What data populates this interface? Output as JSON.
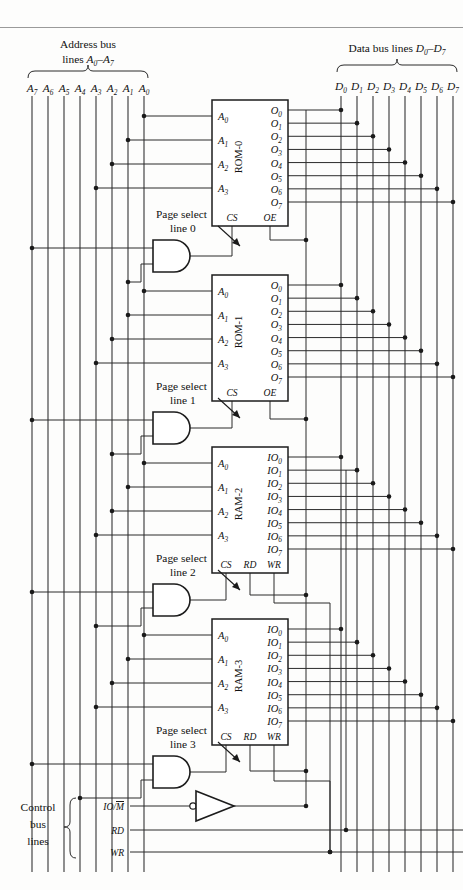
{
  "figure": {
    "kind": "digital-logic-schematic"
  },
  "address_bus": {
    "caption_line1": "Address bus",
    "caption_line2_prefix": "lines ",
    "caption_line2_range": "A",
    "caption_range_sub_lo": "0",
    "caption_range_dash": "–",
    "caption_range_hi": "A",
    "caption_range_sub_hi": "7",
    "lines": [
      {
        "name": "A",
        "sub": "7",
        "x": 32
      },
      {
        "name": "A",
        "sub": "6",
        "x": 48
      },
      {
        "name": "A",
        "sub": "5",
        "x": 64
      },
      {
        "name": "A",
        "sub": "4",
        "x": 80
      },
      {
        "name": "A",
        "sub": "3",
        "x": 96
      },
      {
        "name": "A",
        "sub": "2",
        "x": 112
      },
      {
        "name": "A",
        "sub": "1",
        "x": 128
      },
      {
        "name": "A",
        "sub": "0",
        "x": 144
      }
    ]
  },
  "data_bus": {
    "caption": "Data bus lines ",
    "caption_d": "D",
    "caption_sub_lo": "0",
    "caption_dash": "–",
    "caption_d2": "D",
    "caption_sub_hi": "7",
    "lines": [
      {
        "name": "D",
        "sub": "0",
        "x": 341
      },
      {
        "name": "D",
        "sub": "1",
        "x": 357
      },
      {
        "name": "D",
        "sub": "2",
        "x": 373
      },
      {
        "name": "D",
        "sub": "3",
        "x": 389
      },
      {
        "name": "D",
        "sub": "4",
        "x": 405
      },
      {
        "name": "D",
        "sub": "5",
        "x": 421
      },
      {
        "name": "D",
        "sub": "6",
        "x": 437
      },
      {
        "name": "D",
        "sub": "7",
        "x": 453
      }
    ]
  },
  "chips": [
    {
      "id": "rom0",
      "name": "ROM-0",
      "kind": "rom",
      "x": 212,
      "y": 100,
      "w": 76,
      "h": 126,
      "addr_pins": [
        {
          "name": "A",
          "sub": "0"
        },
        {
          "name": "A",
          "sub": "1"
        },
        {
          "name": "A",
          "sub": "2"
        },
        {
          "name": "A",
          "sub": "3"
        }
      ],
      "data_pins": [
        {
          "name": "O",
          "sub": "0"
        },
        {
          "name": "O",
          "sub": "1"
        },
        {
          "name": "O",
          "sub": "2"
        },
        {
          "name": "O",
          "sub": "3"
        },
        {
          "name": "O",
          "sub": "4"
        },
        {
          "name": "O",
          "sub": "5"
        },
        {
          "name": "O",
          "sub": "6"
        },
        {
          "name": "O",
          "sub": "7"
        }
      ],
      "ctrl_pins": [
        "CS",
        "OE"
      ]
    },
    {
      "id": "rom1",
      "name": "ROM-1",
      "kind": "rom",
      "x": 212,
      "y": 275,
      "w": 76,
      "h": 126,
      "addr_pins": [
        {
          "name": "A",
          "sub": "0"
        },
        {
          "name": "A",
          "sub": "1"
        },
        {
          "name": "A",
          "sub": "2"
        },
        {
          "name": "A",
          "sub": "3"
        }
      ],
      "data_pins": [
        {
          "name": "O",
          "sub": "0"
        },
        {
          "name": "O",
          "sub": "1"
        },
        {
          "name": "O",
          "sub": "2"
        },
        {
          "name": "O",
          "sub": "3"
        },
        {
          "name": "O",
          "sub": "4"
        },
        {
          "name": "O",
          "sub": "5"
        },
        {
          "name": "O",
          "sub": "6"
        },
        {
          "name": "O",
          "sub": "7"
        }
      ],
      "ctrl_pins": [
        "CS",
        "OE"
      ]
    },
    {
      "id": "ram2",
      "name": "RAM-2",
      "kind": "ram",
      "x": 212,
      "y": 447,
      "w": 76,
      "h": 126,
      "addr_pins": [
        {
          "name": "A",
          "sub": "0"
        },
        {
          "name": "A",
          "sub": "1"
        },
        {
          "name": "A",
          "sub": "2"
        },
        {
          "name": "A",
          "sub": "3"
        }
      ],
      "data_pins": [
        {
          "name": "IO",
          "sub": "0"
        },
        {
          "name": "IO",
          "sub": "1"
        },
        {
          "name": "IO",
          "sub": "2"
        },
        {
          "name": "IO",
          "sub": "3"
        },
        {
          "name": "IO",
          "sub": "4"
        },
        {
          "name": "IO",
          "sub": "5"
        },
        {
          "name": "IO",
          "sub": "6"
        },
        {
          "name": "IO",
          "sub": "7"
        }
      ],
      "ctrl_pins": [
        "CS",
        "RD",
        "WR"
      ]
    },
    {
      "id": "ram3",
      "name": "RAM-3",
      "kind": "ram",
      "x": 212,
      "y": 619,
      "w": 76,
      "h": 126,
      "addr_pins": [
        {
          "name": "A",
          "sub": "0"
        },
        {
          "name": "A",
          "sub": "1"
        },
        {
          "name": "A",
          "sub": "2"
        },
        {
          "name": "A",
          "sub": "3"
        }
      ],
      "data_pins": [
        {
          "name": "IO",
          "sub": "0"
        },
        {
          "name": "IO",
          "sub": "1"
        },
        {
          "name": "IO",
          "sub": "2"
        },
        {
          "name": "IO",
          "sub": "3"
        },
        {
          "name": "IO",
          "sub": "4"
        },
        {
          "name": "IO",
          "sub": "5"
        },
        {
          "name": "IO",
          "sub": "6"
        },
        {
          "name": "IO",
          "sub": "7"
        }
      ],
      "ctrl_pins": [
        "CS",
        "RD",
        "WR"
      ]
    }
  ],
  "page_selects": [
    {
      "id": "ps0",
      "line1": "Page select",
      "line2": "line 0",
      "gate_y": 256,
      "label_x": 156,
      "label_y": 218
    },
    {
      "id": "ps1",
      "line1": "Page select",
      "line2": "line 1",
      "gate_y": 428,
      "label_x": 156,
      "label_y": 390
    },
    {
      "id": "ps2",
      "line1": "Page select",
      "line2": "line 2",
      "gate_y": 600,
      "label_x": 156,
      "label_y": 562
    },
    {
      "id": "ps3",
      "line1": "Page select",
      "line2": "line 3",
      "gate_y": 772,
      "label_x": 156,
      "label_y": 734
    }
  ],
  "control_bus": {
    "caption_line1": "Control",
    "caption_line2": "bus",
    "caption_line3": "lines",
    "lines": [
      {
        "id": "iom",
        "label": "IO/",
        "overbar": "M",
        "y": 806,
        "has_overbar": true
      },
      {
        "id": "rd",
        "label": "RD",
        "overbar": "",
        "y": 830,
        "has_overbar": false
      },
      {
        "id": "wr",
        "label": "WR",
        "overbar": "",
        "y": 852,
        "has_overbar": false
      }
    ]
  },
  "inverter": {
    "id": "inv1",
    "x": 196,
    "y": 806,
    "w": 38,
    "h": 30,
    "bubble_side": "input"
  }
}
